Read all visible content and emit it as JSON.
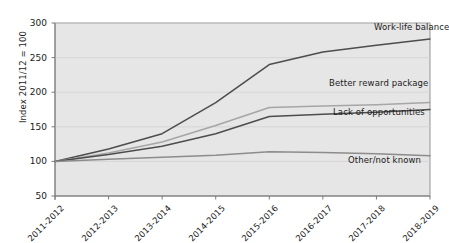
{
  "chart_data": {
    "type": "line",
    "title": "",
    "subtitle": "",
    "xlabel": "",
    "ylabel": "Index 2011/12 = 100",
    "categories": [
      "2011-2012",
      "2012-2013",
      "2013-2014",
      "2014-2015",
      "2015-2016",
      "2016-2017",
      "2017-2018",
      "2018-2019"
    ],
    "yticks": [
      50,
      100,
      150,
      200,
      250,
      300
    ],
    "ylim": [
      50,
      300
    ],
    "grid": true,
    "legend_position": "inline-right",
    "series": [
      {
        "name": "Work-life balance",
        "color": "#4d4d4d",
        "values": [
          100,
          118,
          140,
          185,
          240,
          258,
          268,
          277
        ],
        "label_x": 374,
        "label_y": 22
      },
      {
        "name": "Better reward package",
        "color": "#a6a6a6",
        "values": [
          100,
          112,
          128,
          152,
          178,
          180,
          182,
          185
        ],
        "label_x": 329,
        "label_y": 78
      },
      {
        "name": "Lack of opportunities",
        "color": "#4d4d4d",
        "values": [
          100,
          110,
          122,
          140,
          165,
          168,
          171,
          175
        ],
        "label_x": 333,
        "label_y": 107
      },
      {
        "name": "Other/not known",
        "color": "#8c8c8c",
        "values": [
          100,
          103,
          106,
          109,
          114,
          113,
          111,
          108
        ],
        "label_x": 348,
        "label_y": 155
      }
    ]
  },
  "plot_style": {
    "background": "#e6e6e6",
    "border_color": "#8a8a8a",
    "gridline_color": "#d2d2d2",
    "axis_color": "#7a7a7a",
    "text_color": "#1a1a1a"
  },
  "yticklabels": [
    "300",
    "250",
    "200",
    "150",
    "100",
    "50"
  ]
}
